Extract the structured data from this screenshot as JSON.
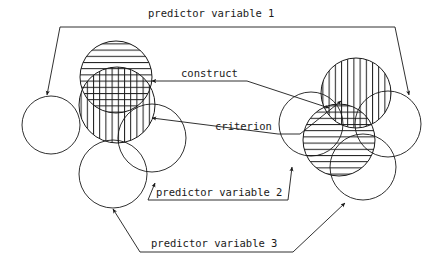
{
  "figure": {
    "title": "",
    "type": "venn-diagram",
    "background_color": "#ffffff",
    "line_color": "#1a1a1a"
  },
  "labels": {
    "predictor_variable_1": "predictor variable 1",
    "predictor_variable_2": "predictor variable 2",
    "predictor_variable_3": "predictor variable 3",
    "construct": "construct",
    "criterion": "criterion"
  },
  "clusters": [
    {
      "name": "left-cluster",
      "circles": [
        {
          "role": "predictor-variable-1",
          "fill_pattern": "none",
          "cx": 51,
          "cy": 125,
          "r": 29
        },
        {
          "role": "construct",
          "fill_pattern": "horizontal-hatch",
          "cx": 116,
          "cy": 77,
          "r": 36
        },
        {
          "role": "criterion",
          "fill_pattern": "vertical-hatch",
          "cx": 117,
          "cy": 105,
          "r": 38
        },
        {
          "role": "predictor-variable-2",
          "fill_pattern": "none",
          "cx": 152,
          "cy": 138,
          "r": 34
        },
        {
          "role": "predictor-variable-3",
          "fill_pattern": "none",
          "cx": 113,
          "cy": 174,
          "r": 34
        }
      ]
    },
    {
      "name": "right-cluster",
      "circles": [
        {
          "role": "construct",
          "fill_pattern": "vertical-hatch",
          "cx": 356,
          "cy": 93,
          "r": 35
        },
        {
          "role": "criterion",
          "fill_pattern": "horizontal-hatch",
          "cx": 339,
          "cy": 140,
          "r": 36
        },
        {
          "role": "predictor-variable-1",
          "fill_pattern": "none",
          "cx": 388,
          "cy": 124,
          "r": 33
        },
        {
          "role": "predictor-variable-2",
          "fill_pattern": "none",
          "cx": 311,
          "cy": 124,
          "r": 32
        },
        {
          "role": "predictor-variable-3",
          "fill_pattern": "none",
          "cx": 363,
          "cy": 167,
          "r": 33
        }
      ]
    }
  ],
  "annotations": [
    {
      "key": "predictor_variable_1",
      "text_x": 148,
      "text_y": 17
    },
    {
      "key": "construct",
      "text_x": 181,
      "text_y": 77
    },
    {
      "key": "criterion",
      "text_x": 215,
      "text_y": 130
    },
    {
      "key": "predictor_variable_2",
      "text_x": 156,
      "text_y": 196
    },
    {
      "key": "predictor_variable_3",
      "text_x": 151,
      "text_y": 247
    }
  ]
}
